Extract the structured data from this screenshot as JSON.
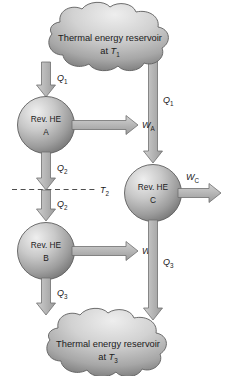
{
  "diagram": {
    "background_color": "#ffffff",
    "stroke_color": "#5a5a5a",
    "text_color": "#1b1b1b",
    "shape_fill_light": "#e8e8e8",
    "shape_fill_mid": "#b8b8b8",
    "shape_fill_dark": "#6e6e6e",
    "arrow_fill": "#b5b5b5",
    "reservoirs": {
      "top": {
        "line1": "Thermal energy reservoir",
        "line2_prefix": "at ",
        "line2_symbol": "T",
        "line2_subscript": "1"
      },
      "bottom": {
        "line1": "Thermal energy reservoir",
        "line2_prefix": "at ",
        "line2_symbol": "T",
        "line2_subscript": "3"
      }
    },
    "engines": [
      {
        "id": "A",
        "line1": "Rev. HE",
        "line2": "A",
        "work_symbol": "W",
        "work_subscript": "A"
      },
      {
        "id": "B",
        "line1": "Rev. HE",
        "line2": "B",
        "work_symbol": "W",
        "work_subscript": "B"
      },
      {
        "id": "C",
        "line1": "Rev. HE",
        "line2": "C",
        "work_symbol": "W",
        "work_subscript": "C"
      }
    ],
    "heat_flows": [
      {
        "name": "q1-left",
        "symbol": "Q",
        "subscript": "1"
      },
      {
        "name": "q2-upper",
        "symbol": "Q",
        "subscript": "2"
      },
      {
        "name": "q2-lower",
        "symbol": "Q",
        "subscript": "2"
      },
      {
        "name": "q3-left",
        "symbol": "Q",
        "subscript": "3"
      },
      {
        "name": "q1-right",
        "symbol": "Q",
        "subscript": "1"
      },
      {
        "name": "q3-right",
        "symbol": "Q",
        "subscript": "3"
      }
    ],
    "intermediate_temperature": {
      "symbol": "T",
      "subscript": "2"
    }
  }
}
